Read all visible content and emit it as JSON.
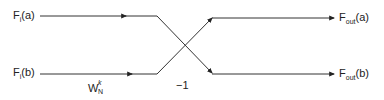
{
  "diagram": {
    "type": "butterfly",
    "line_color": "#333333",
    "inputs": [
      {
        "id": "a",
        "base": "F",
        "sub": "i",
        "arg": "(a)"
      },
      {
        "id": "b",
        "base": "F",
        "sub": "i",
        "arg": "(b)"
      }
    ],
    "outputs": [
      {
        "id": "a",
        "base": "F",
        "sub": "out",
        "arg": "(a)"
      },
      {
        "id": "b",
        "base": "F",
        "sub": "out",
        "arg": "(b)"
      }
    ],
    "twiddle": {
      "base": "W",
      "sub": "N",
      "sup": "k"
    },
    "multiplier": "−1"
  }
}
